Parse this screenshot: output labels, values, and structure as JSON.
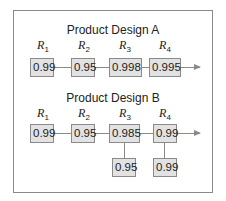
{
  "diagram": {
    "design_a": {
      "title": "Product Design A",
      "labels": [
        {
          "r": "R",
          "sub": "1"
        },
        {
          "r": "R",
          "sub": "2"
        },
        {
          "r": "R",
          "sub": "3"
        },
        {
          "r": "R",
          "sub": "4"
        }
      ],
      "components": [
        "0.99",
        "0.95",
        "0.998",
        "0.995"
      ]
    },
    "design_b": {
      "title": "Product Design B",
      "labels": [
        {
          "r": "R",
          "sub": "1"
        },
        {
          "r": "R",
          "sub": "2"
        },
        {
          "r": "R",
          "sub": "3"
        },
        {
          "r": "R",
          "sub": "4"
        }
      ],
      "components": [
        "0.99",
        "0.95",
        "0.985",
        "0.99"
      ],
      "backups": {
        "r3": "0.95",
        "r4": "0.99"
      }
    },
    "colors": {
      "box_fill": "#e2e2e2",
      "line": "#8a8a8a",
      "text": "#222222"
    }
  }
}
